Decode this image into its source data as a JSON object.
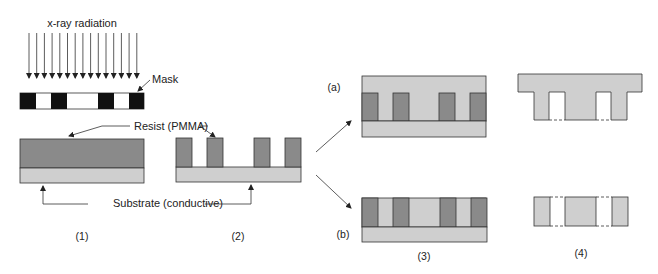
{
  "diagram": {
    "labels": {
      "radiation": "x-ray radiation",
      "mask": "Mask",
      "resist": "Resist (PMMA)",
      "substrate": "Substrate (conductive)",
      "step1": "(1)",
      "step2": "(2)",
      "step3": "(3)",
      "step4": "(4)",
      "branch_a": "(a)",
      "branch_b": "(b)"
    },
    "colors": {
      "resist": "#8a8a8a",
      "substrate": "#cfcfcf",
      "metal": "#cfcfcf",
      "mask_opaque": "#111111",
      "mask_clear": "#ffffff",
      "outline": "#333333",
      "text": "#222222"
    },
    "arrows_count": 15
  }
}
